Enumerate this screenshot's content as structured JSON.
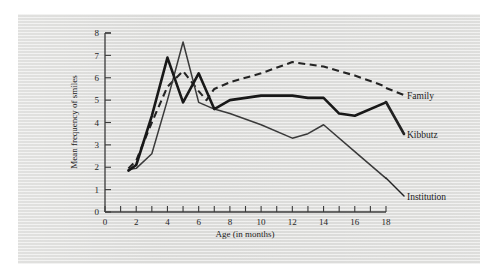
{
  "figure": {
    "background_color": "#dededc",
    "page_color": "#ffffff"
  },
  "chart_data": {
    "type": "line",
    "title": "",
    "subtitle": "",
    "xlabel": "Age (in months)",
    "ylabel": "Mean frequency of smiles",
    "xlim": [
      0,
      18
    ],
    "ylim": [
      0,
      8
    ],
    "xticks": [
      0,
      1,
      2,
      3,
      4,
      5,
      6,
      7,
      8,
      9,
      10,
      11,
      12,
      13,
      14,
      15,
      16,
      17,
      18
    ],
    "xtick_labels": [
      "0",
      "",
      "2",
      "",
      "4",
      "",
      "6",
      "",
      "8",
      "",
      "10",
      "",
      "12",
      "",
      "14",
      "",
      "16",
      "",
      "18"
    ],
    "xtick_labels_shown": [
      "0",
      "2",
      "4",
      "6",
      "8",
      "10",
      "12",
      "14",
      "16",
      "18"
    ],
    "yticks": [
      0,
      1,
      2,
      3,
      4,
      5,
      6,
      7,
      8
    ],
    "ytick_labels": [
      "0",
      "1",
      "2",
      "3",
      "4",
      "5",
      "6",
      "7",
      "8"
    ],
    "grid": false,
    "legend_position": "right-inline-labels",
    "series": [
      {
        "name": "Family",
        "style": "dashed",
        "color": "#242424",
        "label_text": "Family",
        "x": [
          1.5,
          2,
          3,
          4,
          5,
          6,
          6.5,
          7,
          8,
          10,
          12,
          14,
          16,
          18
        ],
        "y": [
          1.95,
          2.3,
          4.0,
          5.6,
          6.3,
          5.4,
          5.0,
          5.5,
          5.8,
          6.2,
          6.7,
          6.5,
          6.1,
          5.6
        ]
      },
      {
        "name": "Kibbutz",
        "style": "solid-thick",
        "color": "#181818",
        "label_text": "Kibbutz",
        "x": [
          1.5,
          2,
          3,
          4,
          5,
          6,
          7,
          8,
          10,
          12,
          13,
          14,
          15,
          16,
          18
        ],
        "y": [
          1.85,
          2.1,
          4.3,
          6.9,
          4.9,
          6.2,
          4.6,
          5.0,
          5.2,
          5.2,
          5.1,
          5.1,
          4.4,
          4.3,
          4.9
        ]
      },
      {
        "name": "Institution",
        "style": "solid-thin",
        "color": "#3a3a3a",
        "label_text": "Institution",
        "x": [
          1.5,
          2,
          3,
          4,
          5,
          6,
          7,
          8,
          10,
          12,
          13,
          14,
          16,
          18
        ],
        "y": [
          1.9,
          1.95,
          2.6,
          5.0,
          7.6,
          4.9,
          4.6,
          4.4,
          3.9,
          3.3,
          3.5,
          3.9,
          2.7,
          1.5
        ]
      }
    ]
  },
  "labels": {
    "family": "Family",
    "kibbutz": "Kibbutz",
    "institution": "Institution",
    "x_axis_title": "Age (in months)",
    "y_axis_title": "Mean frequency of smiles"
  }
}
